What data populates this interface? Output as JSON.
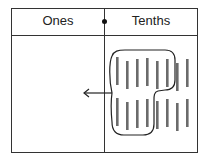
{
  "table": {
    "columns": [
      {
        "label": "Ones"
      },
      {
        "label": "Tenths"
      }
    ]
  },
  "diagram": {
    "tenths_bars_count": 16,
    "grouped_bars_count": 10,
    "arrow_direction": "left",
    "colors": {
      "bar": "#6b6b6b",
      "line": "#222222"
    }
  }
}
